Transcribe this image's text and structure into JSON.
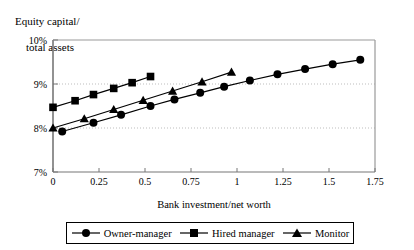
{
  "chart_data": {
    "type": "line",
    "title": "",
    "xlabel": "Bank investment/net worth",
    "ylabel_line1": "Equity capital/",
    "ylabel_line2": "total assets",
    "xlim": [
      0,
      1.75
    ],
    "ylim": [
      7,
      10
    ],
    "xticks": [
      "0",
      "0.25",
      "0.5",
      "0.75",
      "1",
      "1.25",
      "1.5",
      "1.75"
    ],
    "xtick_values": [
      0,
      0.25,
      0.5,
      0.75,
      1,
      1.25,
      1.5,
      1.75
    ],
    "yticks": [
      "7%",
      "8%",
      "9%",
      "10%"
    ],
    "ytick_values": [
      7,
      8,
      9,
      10
    ],
    "grid": "horizontal-dotted-at-8-and-9",
    "legend_position": "bottom",
    "series": [
      {
        "name": "Owner-manager",
        "marker": "circle",
        "color": "#000000",
        "points": [
          {
            "x": 0.05,
            "y": 7.92
          },
          {
            "x": 0.22,
            "y": 8.12
          },
          {
            "x": 0.37,
            "y": 8.3
          },
          {
            "x": 0.53,
            "y": 8.5
          },
          {
            "x": 0.66,
            "y": 8.65
          },
          {
            "x": 0.8,
            "y": 8.8
          },
          {
            "x": 0.93,
            "y": 8.94
          },
          {
            "x": 1.07,
            "y": 9.08
          },
          {
            "x": 1.22,
            "y": 9.22
          },
          {
            "x": 1.37,
            "y": 9.34
          },
          {
            "x": 1.52,
            "y": 9.45
          },
          {
            "x": 1.67,
            "y": 9.55
          }
        ]
      },
      {
        "name": "Hired manager",
        "marker": "square",
        "color": "#000000",
        "points": [
          {
            "x": 0.0,
            "y": 8.47
          },
          {
            "x": 0.12,
            "y": 8.62
          },
          {
            "x": 0.22,
            "y": 8.76
          },
          {
            "x": 0.33,
            "y": 8.9
          },
          {
            "x": 0.43,
            "y": 9.03
          },
          {
            "x": 0.53,
            "y": 9.17
          }
        ]
      },
      {
        "name": "Monitor",
        "marker": "triangle",
        "color": "#000000",
        "points": [
          {
            "x": 0.0,
            "y": 8.0
          },
          {
            "x": 0.17,
            "y": 8.21
          },
          {
            "x": 0.33,
            "y": 8.42
          },
          {
            "x": 0.49,
            "y": 8.63
          },
          {
            "x": 0.65,
            "y": 8.84
          },
          {
            "x": 0.81,
            "y": 9.05
          },
          {
            "x": 0.97,
            "y": 9.27
          }
        ]
      }
    ]
  },
  "legend": {
    "items": [
      {
        "label": "Owner-manager",
        "marker": "circle"
      },
      {
        "label": "Hired manager",
        "marker": "square"
      },
      {
        "label": "Monitor",
        "marker": "triangle"
      }
    ]
  }
}
